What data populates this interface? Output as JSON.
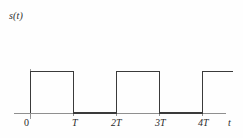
{
  "figure": {
    "kind": "signal-plot",
    "background_color": "#fefefe",
    "curve_color": "#3a3a3a",
    "axis_color": "#8f8f8f",
    "text_color": "#2b2b2b"
  },
  "axes": {
    "y_label": "s(t)",
    "x_label": "t",
    "x_tick_labels": [
      "0",
      "T",
      "2T",
      "3T",
      "4T"
    ]
  },
  "chart_data": {
    "type": "line",
    "title": "",
    "xlabel": "t",
    "ylabel": "s(t)",
    "grid": false,
    "legend": null,
    "xlim": [
      -0.2,
      4.75
    ],
    "ylim": [
      0,
      1.35
    ],
    "x_tick_values": [
      0,
      1,
      2,
      3,
      4
    ],
    "x_tick_labels": [
      "0",
      "T",
      "2T",
      "3T",
      "4T"
    ],
    "y_tick_values": [],
    "y_tick_labels": [],
    "period_T": 1,
    "duty_cycle": 0.5,
    "high_level": 1,
    "low_level": 0,
    "series": [
      {
        "name": "s(t)",
        "x": [
          0,
          0,
          1,
          1,
          2,
          2,
          3,
          3,
          4,
          4,
          4.7
        ],
        "values": [
          0,
          1,
          1,
          0,
          0,
          1,
          1,
          0,
          0,
          1,
          1
        ]
      }
    ],
    "pulses": [
      {
        "start": 0,
        "end": 1,
        "level": 1
      },
      {
        "start": 1,
        "end": 2,
        "level": 0
      },
      {
        "start": 2,
        "end": 3,
        "level": 1
      },
      {
        "start": 3,
        "end": 4,
        "level": 0
      },
      {
        "start": 4,
        "end": 4.7,
        "level": 1
      }
    ]
  }
}
